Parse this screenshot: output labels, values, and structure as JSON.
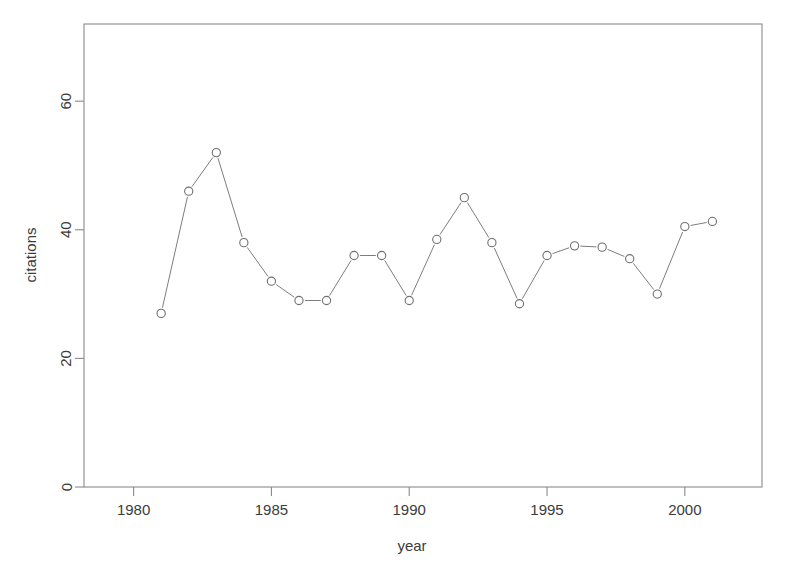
{
  "chart_data": {
    "type": "line",
    "title": "",
    "xlabel": "year",
    "ylabel": "citations",
    "x": [
      1981,
      1982,
      1983,
      1984,
      1985,
      1986,
      1987,
      1988,
      1989,
      1990,
      1991,
      1992,
      1993,
      1994,
      1995,
      1996,
      1997,
      1998,
      1999,
      2000,
      2001
    ],
    "values": [
      27,
      46,
      52,
      38,
      32,
      29,
      29,
      36,
      36,
      29,
      38.5,
      45,
      38,
      28.5,
      36,
      37.5,
      37.3,
      35.5,
      30,
      40.5,
      41.3
    ],
    "series": [
      {
        "name": "citations",
        "values": [
          27,
          46,
          52,
          38,
          32,
          29,
          29,
          36,
          36,
          29,
          38.5,
          45,
          38,
          28.5,
          36,
          37.5,
          37.3,
          35.5,
          30,
          40.5,
          41.3
        ]
      }
    ],
    "xlim": [
      1978.2,
      2002.8
    ],
    "ylim": [
      0,
      72
    ],
    "xticks": [
      1980,
      1985,
      1990,
      1995,
      2000
    ],
    "xtick_labels": [
      "1980",
      "1985",
      "1990",
      "1995",
      "2000"
    ],
    "yticks": [
      0,
      20,
      40,
      60
    ],
    "ytick_labels": [
      "0",
      "20",
      "40",
      "60"
    ],
    "grid": false,
    "legend": null,
    "marker": "open-circle",
    "line_color": "#7d7d7d",
    "marker_fill": "#ffffff",
    "marker_stroke": "#6f6f6f",
    "background": "#ffffff",
    "frame": true
  }
}
